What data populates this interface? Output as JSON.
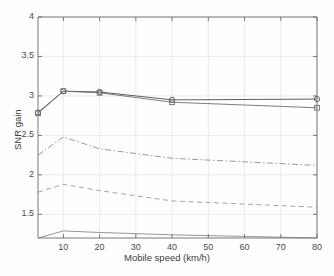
{
  "chart_data": {
    "type": "line",
    "title": "",
    "xlabel": "Mobile speed (km/h)",
    "ylabel": "SNR gain",
    "xlim": [
      3,
      80
    ],
    "ylim": [
      1.2,
      4
    ],
    "xticks": [
      10,
      20,
      30,
      40,
      50,
      60,
      70,
      80
    ],
    "yticks": [
      1.5,
      2,
      2.5,
      3,
      3.5,
      4
    ],
    "ytick_labels": [
      "1.5",
      "2",
      "2.5",
      "3",
      "3.5",
      "4"
    ],
    "xtick_labels": [
      "10",
      "20",
      "30",
      "40",
      "50",
      "60",
      "70",
      "80"
    ],
    "grid": true,
    "legend": "none",
    "x": [
      3,
      10,
      20,
      40,
      80
    ],
    "series": [
      {
        "name": "curve-1-circle-markers",
        "style": "solid",
        "marker": "circle",
        "color": "#4d4d4d",
        "values": [
          2.79,
          3.06,
          3.05,
          2.95,
          2.96
        ]
      },
      {
        "name": "curve-2-square-markers",
        "style": "solid",
        "marker": "square",
        "color": "#6e6e6e",
        "values": [
          2.78,
          3.06,
          3.04,
          2.92,
          2.85
        ]
      },
      {
        "name": "curve-3-dashdot",
        "style": "dashdot",
        "marker": "none",
        "color": "#8c8c8c",
        "values": [
          2.25,
          2.48,
          2.33,
          2.21,
          2.12
        ]
      },
      {
        "name": "curve-4-dashed",
        "style": "dashed",
        "marker": "none",
        "color": "#9a9a9a",
        "values": [
          1.78,
          1.88,
          1.8,
          1.67,
          1.59
        ]
      },
      {
        "name": "curve-5-baseline",
        "style": "solid",
        "marker": "none",
        "color": "#8a8a8a",
        "values": [
          1.2,
          1.29,
          1.27,
          1.24,
          1.2
        ]
      }
    ]
  },
  "axes": {
    "x_label_text": "Mobile speed (km/h)",
    "y_label_text": "SNR gain"
  }
}
